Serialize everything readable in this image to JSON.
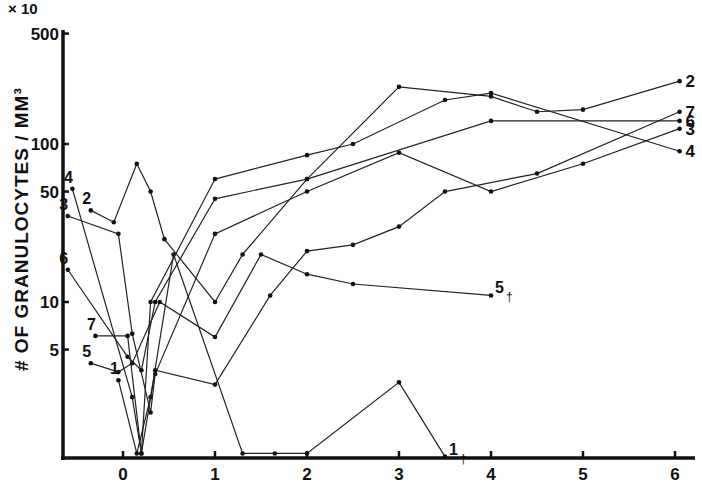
{
  "chart_data": {
    "type": "line",
    "title": "",
    "xlabel": "",
    "ylabel": "# OF GRANULOCYTES / MM³",
    "y_multiplier": "× 10",
    "y_scale": "log",
    "ylim": [
      1,
      500
    ],
    "xlim": [
      -0.65,
      6.3
    ],
    "y_ticks": [
      5,
      10,
      50,
      100,
      500
    ],
    "y_tick_labels": [
      "5",
      "10",
      "50",
      "100",
      "500"
    ],
    "x_ticks": [
      0,
      1,
      2,
      3,
      4,
      5,
      6
    ],
    "x_tick_labels": [
      "0",
      "1",
      "2",
      "3",
      "4",
      "5",
      "6"
    ],
    "grid": false,
    "legend": "inline series labels at line ends",
    "series": [
      {
        "name": "1",
        "label_note": "†",
        "points": [
          [
            -0.05,
            3.2
          ],
          [
            0.15,
            1.1
          ],
          [
            0.3,
            2.5
          ],
          [
            0.55,
            20
          ],
          [
            1.3,
            1.1
          ],
          [
            1.65,
            1.1
          ],
          [
            2.0,
            1.1
          ],
          [
            3.0,
            3.1
          ],
          [
            3.5,
            1.05
          ]
        ]
      },
      {
        "name": "2",
        "points": [
          [
            -0.35,
            38
          ],
          [
            -0.1,
            32
          ],
          [
            0.15,
            75
          ],
          [
            0.3,
            50
          ],
          [
            0.45,
            25
          ],
          [
            1.0,
            10
          ],
          [
            1.3,
            20
          ],
          [
            2.0,
            60
          ],
          [
            3.0,
            230
          ],
          [
            4.0,
            200
          ],
          [
            4.5,
            160
          ],
          [
            5.0,
            165
          ],
          [
            6.05,
            250
          ]
        ]
      },
      {
        "name": "3",
        "points": [
          [
            -0.6,
            35
          ],
          [
            -0.05,
            27
          ],
          [
            0.1,
            6.3
          ],
          [
            0.3,
            2.0
          ],
          [
            0.35,
            3.5
          ],
          [
            1.0,
            27
          ],
          [
            2.0,
            50
          ],
          [
            3.0,
            88
          ],
          [
            4.0,
            50
          ],
          [
            5.0,
            75
          ],
          [
            6.05,
            125
          ]
        ]
      },
      {
        "name": "4",
        "points": [
          [
            -0.55,
            52
          ],
          [
            0.1,
            2.5
          ],
          [
            0.2,
            1.1
          ],
          [
            0.3,
            10
          ],
          [
            1.0,
            60
          ],
          [
            2.0,
            85
          ],
          [
            2.5,
            100
          ],
          [
            3.5,
            190
          ],
          [
            4.0,
            210
          ],
          [
            6.05,
            90
          ]
        ]
      },
      {
        "name": "5",
        "label_note": "†",
        "points": [
          [
            -0.35,
            4.1
          ],
          [
            -0.05,
            3.6
          ],
          [
            0.1,
            4.1
          ],
          [
            0.4,
            10
          ],
          [
            1.0,
            6.0
          ],
          [
            1.5,
            20
          ],
          [
            2.0,
            15
          ],
          [
            2.5,
            13
          ],
          [
            4.0,
            11
          ]
        ]
      },
      {
        "name": "6",
        "points": [
          [
            -0.6,
            16
          ],
          [
            0.05,
            4.5
          ],
          [
            0.2,
            3.7
          ],
          [
            0.35,
            10
          ],
          [
            1.0,
            45
          ],
          [
            2.0,
            60
          ],
          [
            4.0,
            140
          ],
          [
            6.05,
            140
          ]
        ]
      },
      {
        "name": "7",
        "points": [
          [
            -0.3,
            6.1
          ],
          [
            0.05,
            6.1
          ],
          [
            0.2,
            1.1
          ],
          [
            0.35,
            3.7
          ],
          [
            1.0,
            3.0
          ],
          [
            1.6,
            11
          ],
          [
            2.0,
            21
          ],
          [
            2.5,
            23
          ],
          [
            3.0,
            30
          ],
          [
            3.5,
            50
          ],
          [
            4.5,
            65
          ],
          [
            6.05,
            160
          ]
        ]
      }
    ],
    "series_end_labels": [
      "2",
      "7",
      "6",
      "3",
      "4"
    ],
    "series_start_labels": [
      "4",
      "3",
      "6",
      "2",
      "7",
      "5",
      "1"
    ]
  }
}
